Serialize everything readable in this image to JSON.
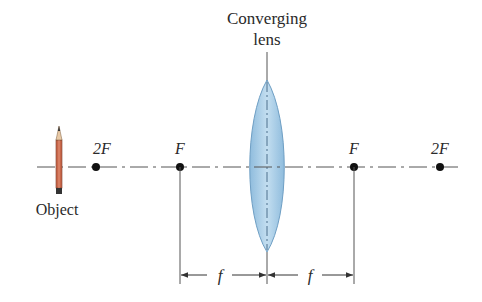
{
  "diagram": {
    "lens_label_line1": "Converging",
    "lens_label_line2": "lens",
    "object_label": "Object",
    "points": [
      {
        "id": "2F-left",
        "label": "2F",
        "x": 96
      },
      {
        "id": "F-left",
        "label": "F",
        "x": 180
      },
      {
        "id": "F-right",
        "label": "F",
        "x": 354
      },
      {
        "id": "2F-right",
        "label": "2F",
        "x": 440
      }
    ],
    "lens_x": 267,
    "axis_y": 167,
    "focal_length_label_left": "f",
    "focal_length_label_right": "f",
    "colors": {
      "lens_fill": "#a9cde6",
      "lens_stroke": "#6f9fc4",
      "pencil_body": "#c8674a",
      "axis": "#555555",
      "dot": "#111111"
    }
  }
}
